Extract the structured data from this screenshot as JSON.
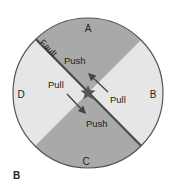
{
  "diagram": {
    "panel_label": "B",
    "quadrant_labels": {
      "top": "A",
      "right": "B",
      "bottom": "C",
      "left": "D"
    },
    "fault_label": "Fault",
    "stress_labels": {
      "upper_push": "Push",
      "left_pull": "Pull",
      "right_pull": "Pull",
      "lower_push": "Push"
    },
    "epicenter_icon": "star-icon",
    "colors": {
      "compression_quadrant": "#a9a9a9",
      "dilatation_quadrant": "#e6e6e6",
      "outline": "#555555",
      "fault_line": "#4a4a4a",
      "text": "#222222"
    }
  }
}
